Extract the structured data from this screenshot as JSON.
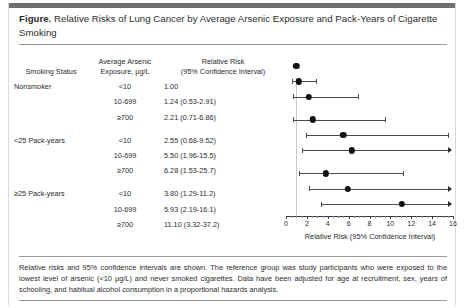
{
  "figure": {
    "label": "Figure.",
    "title": "Relative Risks of Lung Cancer by Average Arsenic Exposure and Pack-Years of Cigarette Smoking",
    "footnote": "Relative risks and 95% confidence intervals are shown. The reference group was study participants who were exposed to the lowest level of arsenic (<10 µg/L) and never smoked cigarettes. Data have been adjusted for age at recruitment, sex, years of schooling, and habitual alcohol consumption in a proportional hazards analysis."
  },
  "table": {
    "headers": {
      "smoking_status": "Smoking Status",
      "exposure": "Average Arsenic\nExposure, µg/L",
      "exposure_line1": "Average Arsenic",
      "exposure_line2": "Exposure, µg/L",
      "relative_risk_line1": "Relative Risk",
      "relative_risk_line2": "(95% Confidence Interval)"
    },
    "rows": [
      {
        "status": "Nonsmoker",
        "exposure": "<10",
        "rr_text": "1.00"
      },
      {
        "status": "",
        "exposure": "10-699",
        "rr_text": "1.24 (0.53-2.91)"
      },
      {
        "status": "",
        "exposure": "≥700",
        "rr_text": "2.21 (0.71-6.86)"
      },
      {
        "status": "<25 Pack-years",
        "exposure": "<10",
        "rr_text": "2.55 (0.68-9.52)"
      },
      {
        "status": "",
        "exposure": "10-699",
        "rr_text": "5.50 (1.96-15.5)"
      },
      {
        "status": "",
        "exposure": "≥700",
        "rr_text": "6.28 (1.53-25.7)"
      },
      {
        "status": "≥25 Pack-years",
        "exposure": "<10",
        "rr_text": "3.80 (1.29-11.2)"
      },
      {
        "status": "",
        "exposure": "10-699",
        "rr_text": "5.93 (2.19-16.1)"
      },
      {
        "status": "",
        "exposure": "≥700",
        "rr_text": "11.10 (3.32-37.2)"
      }
    ]
  },
  "chart_data": {
    "type": "scatter",
    "title": "Relative Risks of Lung Cancer by Average Arsenic Exposure and Pack-Years of Cigarette Smoking",
    "xlabel": "Relative Risk (95% Confidence Interval)",
    "ylabel": "",
    "xlim": [
      0,
      16
    ],
    "xticks": [
      0,
      2,
      4,
      6,
      8,
      10,
      12,
      14,
      16
    ],
    "xticklabels": [
      "0",
      "2",
      "4",
      "6",
      "8",
      "10",
      "12",
      "14",
      "16"
    ],
    "minor_tick_step": 0.5,
    "grid": false,
    "legend": null,
    "reference_line_x": 1.0,
    "marker_color": "#111113",
    "line_color": "#4a4a4c",
    "points": [
      {
        "label": "Nonsmoker, <10",
        "group": "Nonsmoker",
        "exposure": "<10",
        "rr": 1.0,
        "ci_low": null,
        "ci_high": null,
        "truncated": false
      },
      {
        "label": "Nonsmoker, 10-699",
        "group": "Nonsmoker",
        "exposure": "10-699",
        "rr": 1.24,
        "ci_low": 0.53,
        "ci_high": 2.91,
        "truncated": false
      },
      {
        "label": "Nonsmoker, ≥700",
        "group": "Nonsmoker",
        "exposure": "≥700",
        "rr": 2.21,
        "ci_low": 0.71,
        "ci_high": 6.86,
        "truncated": false
      },
      {
        "label": "<25 Pack-years, <10",
        "group": "<25 Pack-years",
        "exposure": "<10",
        "rr": 2.55,
        "ci_low": 0.68,
        "ci_high": 9.52,
        "truncated": false
      },
      {
        "label": "<25 Pack-years, 10-699",
        "group": "<25 Pack-years",
        "exposure": "10-699",
        "rr": 5.5,
        "ci_low": 1.96,
        "ci_high": 15.5,
        "truncated": false
      },
      {
        "label": "<25 Pack-years, ≥700",
        "group": "<25 Pack-years",
        "exposure": "≥700",
        "rr": 6.28,
        "ci_low": 1.53,
        "ci_high": 25.7,
        "truncated": true
      },
      {
        "label": "≥25 Pack-years, <10",
        "group": "≥25 Pack-years",
        "exposure": "<10",
        "rr": 3.8,
        "ci_low": 1.29,
        "ci_high": 11.2,
        "truncated": false
      },
      {
        "label": "≥25 Pack-years, 10-699",
        "group": "≥25 Pack-years",
        "exposure": "10-699",
        "rr": 5.93,
        "ci_low": 2.19,
        "ci_high": 16.1,
        "truncated": true
      },
      {
        "label": "≥25 Pack-years, ≥700",
        "group": "≥25 Pack-years",
        "exposure": "≥700",
        "rr": 11.1,
        "ci_low": 3.32,
        "ci_high": 37.2,
        "truncated": true
      }
    ]
  }
}
